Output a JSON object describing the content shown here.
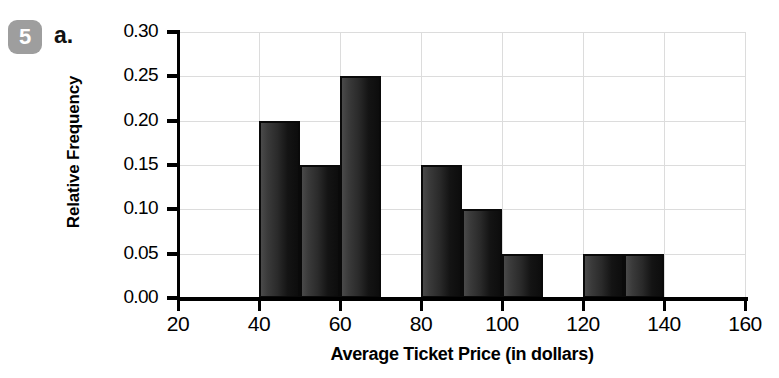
{
  "badge": {
    "number": "5"
  },
  "part": {
    "label": "a."
  },
  "chart_data": {
    "type": "bar",
    "title": "",
    "xlabel": "Average Ticket Price (in dollars)",
    "ylabel": "Relative Frequency",
    "xlim": [
      20,
      160
    ],
    "ylim": [
      0.0,
      0.3
    ],
    "grid": true,
    "legend": "none",
    "bin_width": 10,
    "x_ticks": [
      "20",
      "40",
      "60",
      "80",
      "100",
      "120",
      "140",
      "160"
    ],
    "x_tick_values": [
      20,
      40,
      60,
      80,
      100,
      120,
      140,
      160
    ],
    "y_ticks": [
      "0.00",
      "0.05",
      "0.10",
      "0.15",
      "0.20",
      "0.25",
      "0.30"
    ],
    "y_tick_values": [
      0.0,
      0.05,
      0.1,
      0.15,
      0.2,
      0.25,
      0.3
    ],
    "bins": [
      {
        "start": 40,
        "end": 50,
        "value": 0.2
      },
      {
        "start": 50,
        "end": 60,
        "value": 0.15
      },
      {
        "start": 60,
        "end": 70,
        "value": 0.25
      },
      {
        "start": 80,
        "end": 90,
        "value": 0.15
      },
      {
        "start": 90,
        "end": 100,
        "value": 0.1
      },
      {
        "start": 100,
        "end": 110,
        "value": 0.05
      },
      {
        "start": 120,
        "end": 130,
        "value": 0.05
      },
      {
        "start": 130,
        "end": 140,
        "value": 0.05
      }
    ],
    "categories": [
      "40-50",
      "50-60",
      "60-70",
      "80-90",
      "90-100",
      "100-110",
      "120-130",
      "130-140"
    ],
    "values": [
      0.2,
      0.15,
      0.25,
      0.15,
      0.1,
      0.05,
      0.05,
      0.05
    ],
    "colors": {
      "bar_fill_light": "#4a4a4a",
      "bar_fill_dark": "#0d0d0d",
      "bar_border": "#0a0a0a",
      "gridline": "#dcdcdc",
      "axis": "#000000",
      "badge_bg": "#9e9e9e",
      "badge_text": "#ffffff"
    }
  }
}
